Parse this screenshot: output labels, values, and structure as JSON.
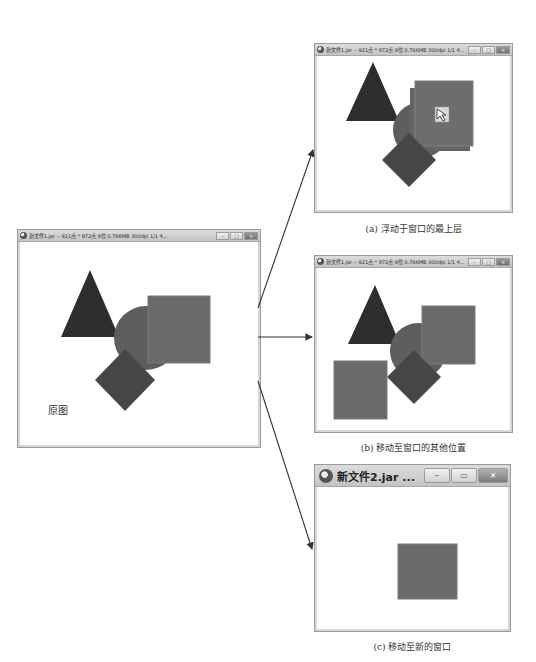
{
  "windows": {
    "original": {
      "title": "新文件1.jar -- 921点 * 872点 8位  0.766MB 300dpi 1/1  4...",
      "label": "原图",
      "controls": {
        "minimize": "–",
        "maximize": "□",
        "close": "×"
      }
    },
    "a": {
      "title": "新文件1.jar -- 921点 * 872点 8位  0.766MB 300dpi 1/1  4...",
      "caption": "(a) 浮动于窗口的最上层",
      "controls": {
        "minimize": "–",
        "maximize": "□",
        "close": "×"
      }
    },
    "b": {
      "title": "新文件1.jar -- 921点 * 872点 8位  0.766MB 300dpi 1/1  4...",
      "caption": "(b) 移动至窗口的其他位置",
      "controls": {
        "minimize": "–",
        "maximize": "□",
        "close": "×"
      }
    },
    "c": {
      "title": "新文件2.jar ...",
      "caption": "(c) 移动至新的窗口",
      "controls": {
        "minimize": "–",
        "maximize": "▭",
        "close": "✕"
      }
    }
  },
  "colors": {
    "triangle": "#2e2e2e",
    "circle": "#5e5e5e",
    "square": "#6a6a6a",
    "diamond": "#474747",
    "arrow": "#333333"
  },
  "icons": {
    "app": "app-icon",
    "cursor": "move-cursor-icon"
  }
}
